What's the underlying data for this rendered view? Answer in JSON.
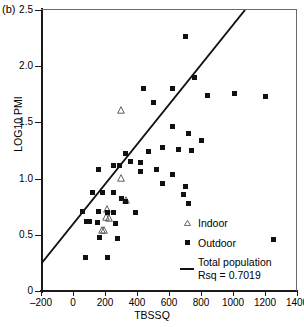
{
  "panel": {
    "tag": "(b)"
  },
  "chart_data": {
    "type": "scatter",
    "title": "",
    "xlabel": "TBSSQ",
    "ylabel": "LOG10 PMI",
    "xlim": [
      -200,
      1400
    ],
    "ylim": [
      0,
      2.5
    ],
    "xticks": [
      -200,
      0,
      200,
      400,
      600,
      800,
      1000,
      1200,
      1400
    ],
    "xtick_labels": [
      "–200",
      "0",
      "200",
      "400",
      "600",
      "800",
      "1000",
      "1200",
      "1400"
    ],
    "yticks": [
      0,
      0.5,
      1.0,
      1.5,
      2.0,
      2.5
    ],
    "ytick_labels": [
      "0",
      "0.5",
      "1.0",
      "1.5",
      "2.0",
      "2.5"
    ],
    "grid": false,
    "legend_position": "bottom-right",
    "series": [
      {
        "name": "Indoor",
        "marker": "triangle",
        "color": "#111111",
        "points": [
          [
            300,
            1.66
          ],
          [
            300,
            1.06
          ],
          [
            330,
            0.86
          ],
          [
            215,
            0.78
          ],
          [
            205,
            0.71
          ],
          [
            222,
            0.7
          ],
          [
            182,
            0.6
          ],
          [
            196,
            0.6
          ]
        ]
      },
      {
        "name": "Outdoor",
        "marker": "square",
        "color": "#111111",
        "points": [
          [
            440,
            1.8
          ],
          [
            620,
            1.8
          ],
          [
            500,
            1.68
          ],
          [
            700,
            2.26
          ],
          [
            760,
            1.9
          ],
          [
            840,
            1.74
          ],
          [
            1010,
            1.76
          ],
          [
            1200,
            1.73
          ],
          [
            620,
            1.46
          ],
          [
            720,
            1.4
          ],
          [
            800,
            1.34
          ],
          [
            660,
            1.26
          ],
          [
            740,
            1.25
          ],
          [
            560,
            1.28
          ],
          [
            470,
            1.24
          ],
          [
            330,
            1.22
          ],
          [
            360,
            1.15
          ],
          [
            420,
            1.14
          ],
          [
            420,
            1.06
          ],
          [
            520,
            1.08
          ],
          [
            250,
            1.12
          ],
          [
            290,
            1.12
          ],
          [
            160,
            1.08
          ],
          [
            620,
            1.04
          ],
          [
            560,
            0.96
          ],
          [
            700,
            0.93
          ],
          [
            690,
            0.86
          ],
          [
            720,
            0.78
          ],
          [
            120,
            0.88
          ],
          [
            185,
            0.88
          ],
          [
            255,
            0.88
          ],
          [
            300,
            0.82
          ],
          [
            325,
            0.8
          ],
          [
            60,
            0.71
          ],
          [
            160,
            0.71
          ],
          [
            215,
            0.7
          ],
          [
            255,
            0.7
          ],
          [
            390,
            0.7
          ],
          [
            85,
            0.62
          ],
          [
            105,
            0.62
          ],
          [
            150,
            0.61
          ],
          [
            265,
            0.6
          ],
          [
            165,
            0.48
          ],
          [
            280,
            0.47
          ],
          [
            1250,
            0.46
          ],
          [
            80,
            0.3
          ],
          [
            215,
            0.3
          ]
        ]
      }
    ],
    "fit_line": {
      "name": "Total population",
      "rsq_label": "Rsq = 0.7019",
      "rsq": 0.7019,
      "x_start": -200,
      "y_start": 0.24,
      "x_end": 1075,
      "y_end": 2.5
    }
  },
  "legend": {
    "items": [
      {
        "label": "Indoor",
        "marker": "triangle"
      },
      {
        "label": "Outdoor",
        "marker": "square"
      },
      {
        "label": "Total population",
        "marker": "line"
      }
    ],
    "rsq_text": "Rsq = 0.7019"
  }
}
